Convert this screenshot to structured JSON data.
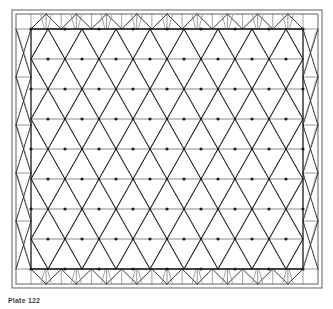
{
  "figure": {
    "caption": "Plate 122",
    "medium": "scanned line drawing",
    "background_color": "#ffffff",
    "line_color": "#1d1d1d",
    "secondary_line_color": "#7d7d7d",
    "frame_line_color": "#6e6e6e"
  },
  "outer_frame": {
    "name": "double-line border",
    "x": 12,
    "y": 10,
    "width": 310,
    "height": 278,
    "gap": 4
  },
  "perimeter_truss": {
    "band_width": 15,
    "top_bays": 9,
    "bottom_bays": 9,
    "left_bays": 5,
    "right_bays": 5,
    "top_pattern": "a-frame-fan",
    "bottom_pattern": "inverted-v-fan",
    "side_pattern": "x-brace"
  },
  "inner_grid": {
    "name": "triangulated space frame grid",
    "x": 31,
    "y": 29,
    "width": 272,
    "height": 240,
    "columns": 8,
    "rows": 8,
    "pattern": "triangular-lattice",
    "horizontal_chords": 9,
    "diagonal_direction": "both",
    "node_marker": "filled-dot",
    "node_radius": 1.6
  },
  "chart_data": {
    "type": "diagram",
    "categories": [],
    "values": []
  }
}
